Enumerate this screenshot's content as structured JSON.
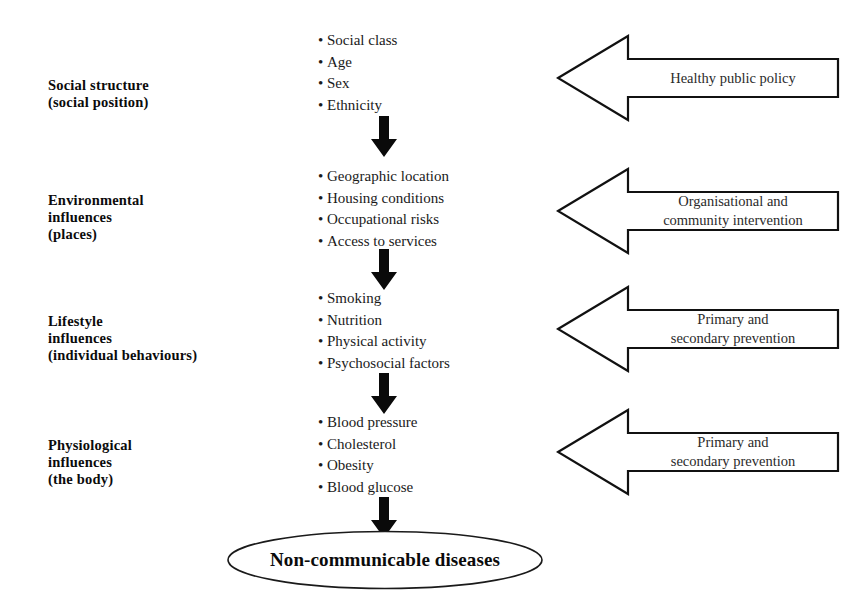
{
  "diagram": {
    "stroke_color": "#000000",
    "fill_color": "#ffffff",
    "text_color": "#1a1a1a"
  },
  "stages": [
    {
      "label_line1": "Social structure",
      "label_line2": "(social position)",
      "items": [
        "Social class",
        "Age",
        "Sex",
        "Ethnicity"
      ],
      "bullet_glyph": "•"
    },
    {
      "label_line1": "Environmental\ninfluences",
      "label_line2": "(places)",
      "items": [
        "Geographic location",
        "Housing conditions",
        "Occupational risks",
        "Access to services"
      ],
      "bullet_glyph": "•"
    },
    {
      "label_line1": "Lifestyle\ninfluences",
      "label_line2": "(individual behaviours)",
      "items": [
        "Smoking",
        "Nutrition",
        "Physical activity",
        "Psychosocial factors"
      ],
      "bullet_glyph": "•"
    },
    {
      "label_line1": "Physiological\ninfluences",
      "label_line2": "(the body)",
      "items": [
        "Blood pressure",
        "Cholesterol",
        "Obesity",
        "Blood glucose"
      ],
      "bullet_glyph": "•"
    }
  ],
  "interventions": [
    {
      "text": "Healthy public policy"
    },
    {
      "text": "Organisational and\ncommunity intervention"
    },
    {
      "text": "Primary and\nsecondary prevention"
    },
    {
      "text": "Primary and\nsecondary prevention"
    }
  ],
  "outcome": {
    "label": "Non-communicable diseases"
  }
}
